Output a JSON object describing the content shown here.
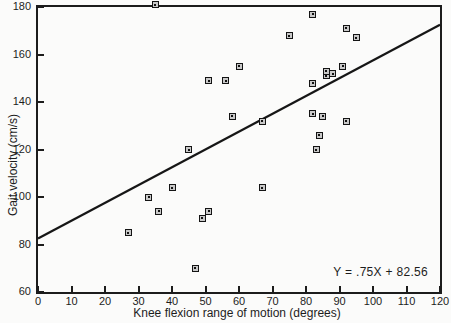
{
  "chart_data": {
    "type": "scatter",
    "title": "",
    "xlabel": "Knee flexion range of motion (degrees)",
    "ylabel": "Gait velocity (cm/s)",
    "xlim": [
      0,
      120
    ],
    "ylim": [
      60,
      180
    ],
    "x_ticks": [
      0,
      10,
      20,
      30,
      40,
      50,
      60,
      70,
      80,
      90,
      100,
      110,
      120
    ],
    "y_ticks": [
      60,
      80,
      100,
      120,
      140,
      160,
      180
    ],
    "grid": "off",
    "marker_style": "small square outline with center dot, light gray fill",
    "points": [
      [
        35,
        181
      ],
      [
        82,
        177
      ],
      [
        92,
        171
      ],
      [
        95,
        167
      ],
      [
        75,
        168
      ],
      [
        60,
        155
      ],
      [
        51,
        149
      ],
      [
        56,
        149
      ],
      [
        82,
        148
      ],
      [
        86,
        151
      ],
      [
        86,
        153
      ],
      [
        88,
        152
      ],
      [
        91,
        155
      ],
      [
        45,
        120
      ],
      [
        58,
        134
      ],
      [
        67,
        132
      ],
      [
        82,
        135
      ],
      [
        85,
        134
      ],
      [
        92,
        132
      ],
      [
        84,
        126
      ],
      [
        83,
        120
      ],
      [
        67,
        104
      ],
      [
        40,
        104
      ],
      [
        33,
        100
      ],
      [
        36,
        94
      ],
      [
        27,
        85
      ],
      [
        49,
        91
      ],
      [
        51,
        94
      ],
      [
        47,
        70
      ]
    ],
    "regression_line": {
      "slope": 0.75,
      "intercept": 82.56,
      "label": "Y = .75X + 82.56"
    },
    "colors": {
      "ink": "#1c1c1c",
      "marker_fill": "#c9c9c9",
      "background": "#fbfbfa"
    }
  }
}
